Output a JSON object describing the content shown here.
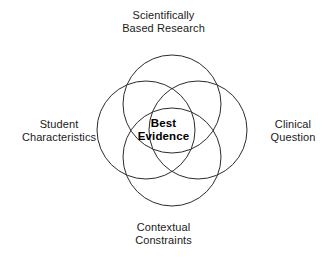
{
  "diagram": {
    "type": "venn",
    "title": "Best Evidence",
    "shape": "four-circle-venn",
    "background_color": "#ffffff",
    "stroke_color": "#2b2b2b",
    "text_color": "#1a1a1a",
    "center_text_color": "#000000",
    "center": {
      "line1": "Best",
      "line2": "Evidence"
    },
    "labels": {
      "top": {
        "line1": "Scientifically",
        "line2": "Based Research"
      },
      "left": {
        "line1": "Student",
        "line2": "Characteristics"
      },
      "right": {
        "line1": "Clinical",
        "line2": "Question"
      },
      "bottom": {
        "line1": "Contextual",
        "line2": "Constraints"
      }
    }
  }
}
